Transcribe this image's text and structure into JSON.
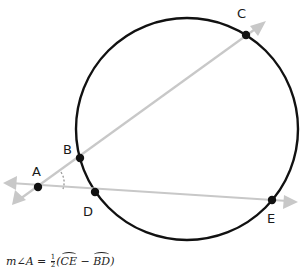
{
  "diagram": {
    "points": [
      {
        "name": "A",
        "x": 38,
        "y": 187,
        "label_x": 32,
        "label_y": 176
      },
      {
        "name": "B",
        "x": 80,
        "y": 158,
        "label_x": 64,
        "label_y": 154
      },
      {
        "name": "C",
        "x": 246,
        "y": 35,
        "label_x": 237,
        "label_y": 18
      },
      {
        "name": "D",
        "x": 95,
        "y": 192,
        "label_x": 84,
        "label_y": 214
      },
      {
        "name": "E",
        "x": 272,
        "y": 200,
        "label_x": 268,
        "label_y": 221
      }
    ],
    "circle": {
      "cx": 187,
      "cy": 129,
      "r": 111,
      "color": "#111111"
    },
    "ray_color": "#c8c8c8",
    "point_color": "#111111"
  },
  "formula": {
    "lhs": "m∠A = ",
    "frac_num": "1",
    "frac_den": "2",
    "open": "(",
    "arc1": "CE",
    "minus": " − ",
    "arc2": "BD",
    "close": ")"
  }
}
